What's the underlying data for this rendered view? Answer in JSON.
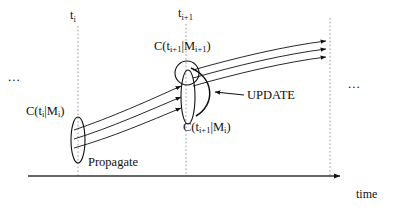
{
  "figure": {
    "type": "state-propagation-update-diagram",
    "background_color": "#ffffff",
    "ink_color": "#111111",
    "guide_color": "#9a9a9a"
  },
  "axis": {
    "name": "time-axis",
    "label": "time",
    "orientation": "horizontal",
    "arrowhead": "right",
    "x_start": 28,
    "x_end": 345,
    "y": 176
  },
  "time_ticks": [
    {
      "id": "t-i",
      "label_base": "t",
      "label_sub": "i",
      "x": 78,
      "dashed": true
    },
    {
      "id": "t-i-plus-1",
      "label_base": "t",
      "label_sub": "i+1",
      "x": 186,
      "dashed": true
    },
    {
      "id": "t-right",
      "label_base": "",
      "label_sub": "",
      "x": 330,
      "dashed": true
    }
  ],
  "ellipsis": {
    "left": "...",
    "right": "..."
  },
  "covariance_labels": [
    {
      "id": "c-ti-mi",
      "text": "C(t i|M i)",
      "parts": [
        "C(t",
        "i",
        "|M",
        "i",
        ")"
      ],
      "at_time": "t_i",
      "x": 26,
      "y": 105
    },
    {
      "id": "c-tip1-mip1",
      "text": "C(t i+1|M i+1)",
      "parts": [
        "C(t",
        "i+1",
        "|M",
        "i+1",
        ")"
      ],
      "at_time": "t_i+1",
      "x": 154,
      "y": 40
    },
    {
      "id": "c-tip1-mi",
      "text": "C(t i+1|M i)",
      "parts": [
        "C(t",
        "i+1",
        "|M",
        "i",
        ")"
      ],
      "at_time": "t_i+1",
      "x": 183,
      "y": 121
    }
  ],
  "annotations": [
    {
      "id": "update",
      "label": "UPDATE",
      "x": 247,
      "y": 89,
      "has_arrow": true
    },
    {
      "id": "propagate",
      "label": "Propagate",
      "x": 88,
      "y": 156,
      "has_arrow": false
    }
  ],
  "uncertainty_ellipses": [
    {
      "id": "ellipse-prior",
      "cx": 78,
      "cy": 140,
      "rx": 7,
      "ry": 23,
      "rotation": 0
    },
    {
      "id": "ellipse-propagated",
      "cx": 188,
      "cy": 97,
      "rx": 7,
      "ry": 27,
      "rotation": 0
    },
    {
      "id": "ellipse-updated",
      "cx": 188,
      "cy": 74,
      "rx": 12,
      "ry": 12,
      "rotation": 0
    }
  ],
  "trajectories": {
    "name": "propagated-state-curves",
    "count": 3,
    "left_segment": "from prior ellipse at t_i to propagated ellipse at t_i+1",
    "right_segment": "from updated ellipse at t_i+1 to right dashed line"
  }
}
